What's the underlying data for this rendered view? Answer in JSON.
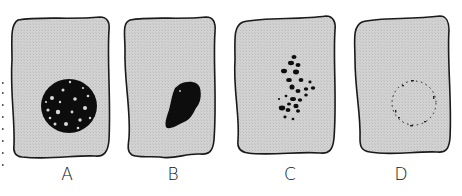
{
  "figure": {
    "panels": [
      {
        "id": "A",
        "label": "A",
        "description": "cell with large mottled (granular) round nucleus"
      },
      {
        "id": "B",
        "label": "B",
        "description": "cell with shrunken, dense dark irregular nucleus"
      },
      {
        "id": "C",
        "label": "C",
        "description": "cell with nucleus fragmented into scattered dark clumps"
      },
      {
        "id": "D",
        "label": "D",
        "description": "cell with faint dotted outline where nucleus has dissolved"
      }
    ],
    "colors": {
      "cytoplasm": "#cfcfcf",
      "outline": "#1a1a1a",
      "nucleus": "#0d0d0d",
      "background": "#ffffff"
    }
  }
}
